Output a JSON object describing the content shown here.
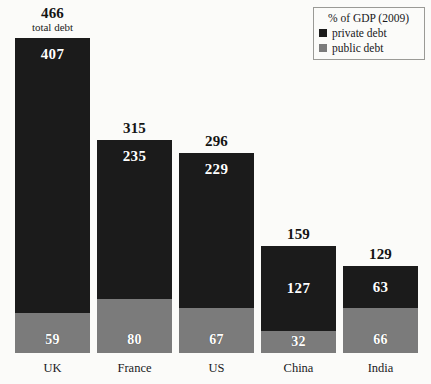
{
  "legend": {
    "title": "% of GDP (2009)",
    "items": [
      {
        "label": "private debt",
        "color": "#1b1b1b",
        "swatch": "legend-swatch-private"
      },
      {
        "label": "public debt",
        "color": "#7b7b7b",
        "swatch": "legend-swatch-public"
      }
    ]
  },
  "annotations": {
    "total_note": "total debt"
  },
  "colors": {
    "private": "#1b1b1b",
    "public": "#7b7b7b",
    "background": "#fbfbf9",
    "text": "#18181a"
  },
  "chart_data": {
    "type": "bar",
    "subtype": "stacked",
    "title": "",
    "subtitle": "",
    "xlabel": "",
    "ylabel": "% of GDP (2009)",
    "ylim": [
      0,
      466
    ],
    "grid": false,
    "legend_position": "top-right",
    "categories": [
      "UK",
      "France",
      "US",
      "China",
      "India"
    ],
    "series": [
      {
        "name": "private debt",
        "color": "#1b1b1b",
        "values": [
          407,
          235,
          229,
          127,
          63
        ]
      },
      {
        "name": "public debt",
        "color": "#7b7b7b",
        "values": [
          59,
          80,
          67,
          32,
          66
        ]
      }
    ],
    "totals": [
      466,
      315,
      296,
      159,
      129
    ],
    "total_labels": [
      "466",
      "315",
      "296",
      "159",
      "129"
    ],
    "private_labels": [
      "407",
      "235",
      "229",
      "127",
      "63"
    ],
    "public_labels": [
      "59",
      "80",
      "67",
      "32",
      "66"
    ],
    "annotated_total_index": 0
  }
}
